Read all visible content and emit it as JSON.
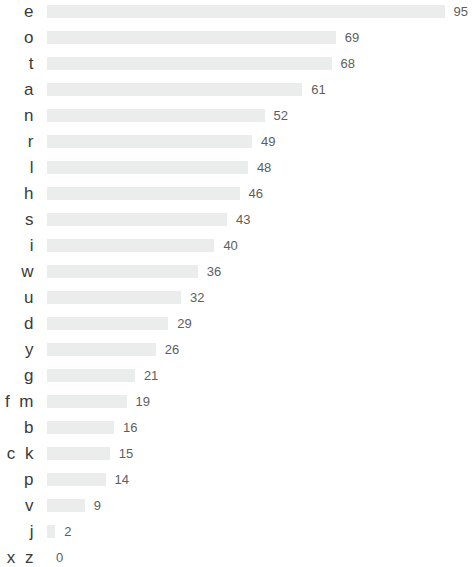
{
  "chart_data": {
    "type": "bar",
    "orientation": "horizontal",
    "title": "",
    "subtitle": "",
    "xlabel": "",
    "ylabel": "",
    "xlim": [
      0,
      95
    ],
    "grid": false,
    "legend": null,
    "bar_color": "#ebeded",
    "label_color": "#3b3b3b",
    "value_color": "#5e5e5e",
    "background_color": "#ffffff",
    "categories": [
      "e",
      "o",
      "t",
      "a",
      "n",
      "r",
      "l",
      "h",
      "s",
      "i",
      "w",
      "u",
      "d",
      "y",
      "g",
      "f m",
      "b",
      "c k",
      "p",
      "v",
      "j",
      "q x z"
    ],
    "values": [
      95,
      69,
      68,
      61,
      52,
      49,
      48,
      46,
      43,
      40,
      36,
      32,
      29,
      26,
      21,
      19,
      16,
      15,
      14,
      9,
      2,
      0
    ],
    "value_labels": [
      "95",
      "69",
      "68",
      "61",
      "52",
      "49",
      "48",
      "46",
      "43",
      "40",
      "36",
      "32",
      "29",
      "26",
      "21",
      "19",
      "16",
      "15",
      "14",
      "9",
      "2",
      "0"
    ],
    "rows": [
      {
        "label": "e",
        "value": 95,
        "value_label": "95"
      },
      {
        "label": "o",
        "value": 69,
        "value_label": "69"
      },
      {
        "label": "t",
        "value": 68,
        "value_label": "68"
      },
      {
        "label": "a",
        "value": 61,
        "value_label": "61"
      },
      {
        "label": "n",
        "value": 52,
        "value_label": "52"
      },
      {
        "label": "r",
        "value": 49,
        "value_label": "49"
      },
      {
        "label": "l",
        "value": 48,
        "value_label": "48"
      },
      {
        "label": "h",
        "value": 46,
        "value_label": "46"
      },
      {
        "label": "s",
        "value": 43,
        "value_label": "43"
      },
      {
        "label": "i",
        "value": 40,
        "value_label": "40"
      },
      {
        "label": "w",
        "value": 36,
        "value_label": "36"
      },
      {
        "label": "u",
        "value": 32,
        "value_label": "32"
      },
      {
        "label": "d",
        "value": 29,
        "value_label": "29"
      },
      {
        "label": "y",
        "value": 26,
        "value_label": "26"
      },
      {
        "label": "g",
        "value": 21,
        "value_label": "21"
      },
      {
        "label": "f m",
        "value": 19,
        "value_label": "19"
      },
      {
        "label": "b",
        "value": 16,
        "value_label": "16"
      },
      {
        "label": "c k",
        "value": 15,
        "value_label": "15"
      },
      {
        "label": "p",
        "value": 14,
        "value_label": "14"
      },
      {
        "label": "v",
        "value": 9,
        "value_label": "9"
      },
      {
        "label": "j",
        "value": 2,
        "value_label": "2"
      },
      {
        "label": "q x z",
        "value": 0,
        "value_label": "0"
      }
    ]
  },
  "layout": {
    "row_height": 26,
    "first_row_top": -1,
    "bar_origin_x": 47,
    "px_per_unit": 4.185,
    "value_gap": 9
  }
}
